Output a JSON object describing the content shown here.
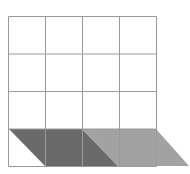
{
  "diagram": {
    "grid": {
      "rows": 4,
      "cols": 4,
      "x0": 8.5,
      "y0": 16.5,
      "cell_w": 37,
      "cell_h": 37.5,
      "line_color": "#9a9a9a"
    },
    "shapes": [
      {
        "name": "dark-parallelogram",
        "fill": "#6a6a6a",
        "points": "9,129 82,129 118,166 45,166"
      },
      {
        "name": "light-parallelogram",
        "fill": "#a2a2a2",
        "points": "82,129 156,129 189,166 118,166"
      }
    ]
  }
}
